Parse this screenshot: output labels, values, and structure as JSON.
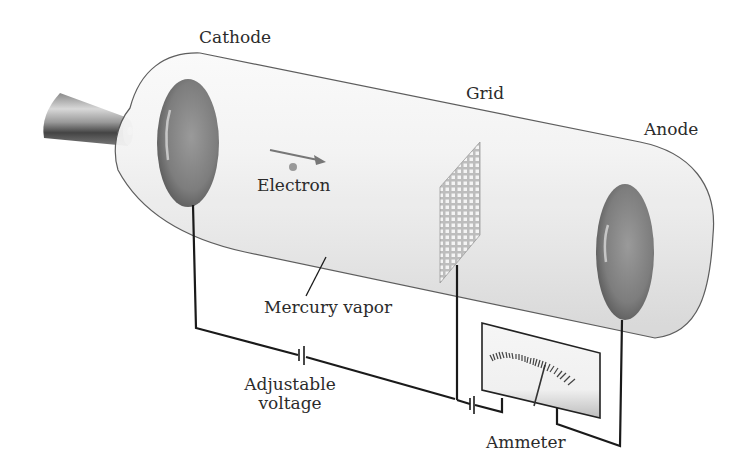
{
  "diagram": {
    "labels": {
      "cathode": "Cathode",
      "grid": "Grid",
      "anode": "Anode",
      "electron": "Electron",
      "mercury_vapor": "Mercury vapor",
      "adjustable_voltage_line1": "Adjustable",
      "adjustable_voltage_line2": "voltage",
      "ammeter": "Ammeter"
    },
    "colors": {
      "background": "#ffffff",
      "tube_outline": "#555555",
      "tube_fill": "#eeeeee",
      "electrode": "#7a7a7a",
      "wire": "#1a1a1a",
      "text": "#2b2b2b",
      "arrow": "#777777"
    }
  }
}
